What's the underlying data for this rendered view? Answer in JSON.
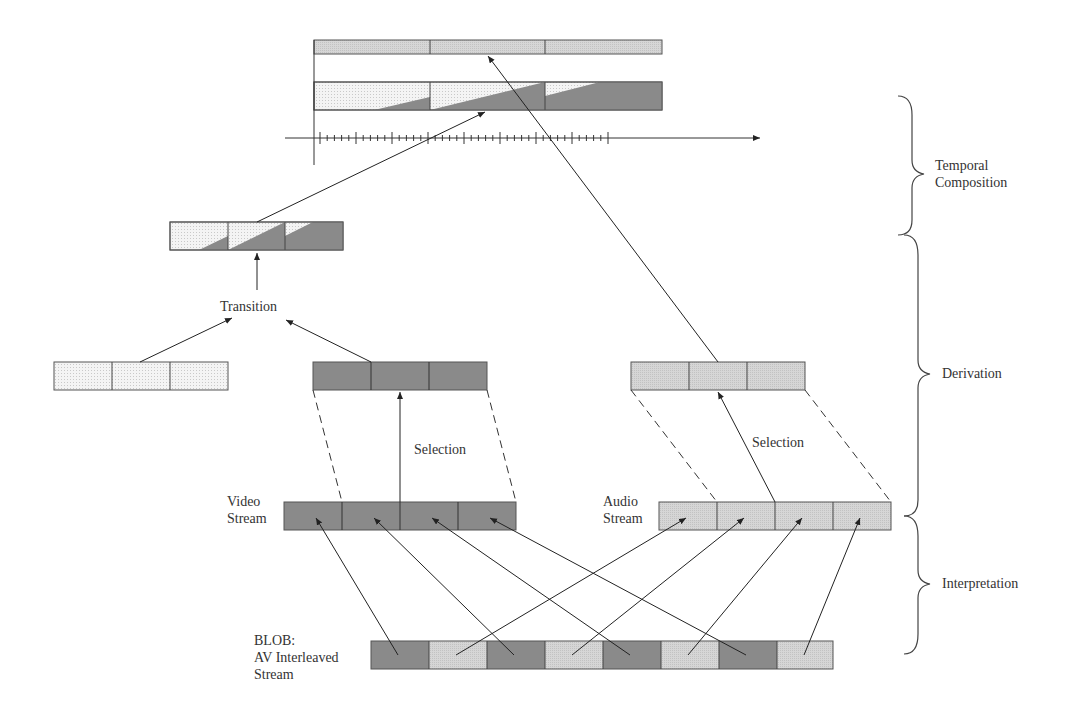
{
  "labels": {
    "transition": "Transition",
    "selection_video": "Selection",
    "selection_audio": "Selection",
    "video_stream_1": "Video",
    "video_stream_2": "Stream",
    "audio_stream_1": "Audio",
    "audio_stream_2": "Stream",
    "blob_1": "BLOB:",
    "blob_2": "AV Interleaved",
    "blob_3": "Stream"
  },
  "braces": {
    "temporal_1": "Temporal",
    "temporal_2": "Composition",
    "derivation": "Derivation",
    "interpretation": "Interpretation"
  },
  "colors": {
    "video_fill": "#8a8a8a",
    "audio_fill": "#d2d2d2",
    "light_fill": "#f0f0f0",
    "stroke": "#444444"
  }
}
